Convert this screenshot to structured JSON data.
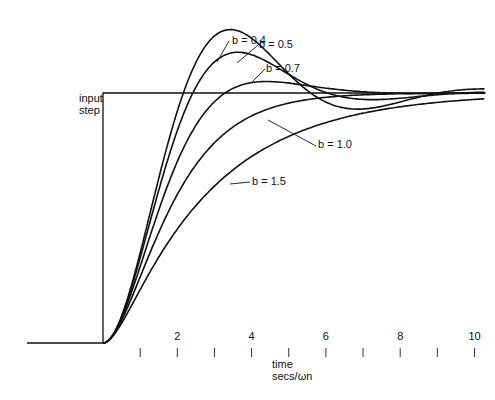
{
  "chart_data": {
    "type": "line",
    "title": "",
    "xlabel": "time secs/ωn",
    "xlabel_lines": [
      "time",
      "secs/ωn"
    ],
    "ylabel": "",
    "x_ticks": [
      1,
      2,
      3,
      4,
      5,
      6,
      7,
      8,
      9,
      10
    ],
    "x_tick_labels": {
      "2": "2",
      "4": "4",
      "6": "6",
      "8": "8",
      "10": "10"
    },
    "xlim": [
      -2.1,
      10.3
    ],
    "ylim": [
      0,
      1.3
    ],
    "grid": false,
    "input_label_lines": [
      "input",
      "step"
    ],
    "input_step": {
      "t_start": 0,
      "level": 1.0
    },
    "series": [
      {
        "name": "b = 0.4",
        "damping": 0.4,
        "label_pos": [
          232,
          44
        ],
        "leader": [
          [
            229,
            41
          ],
          [
            217,
            62
          ]
        ]
      },
      {
        "name": "b = 0.5",
        "damping": 0.5,
        "label_pos": [
          259,
          48
        ],
        "leader": [
          [
            258,
            45
          ],
          [
            237,
            63
          ]
        ]
      },
      {
        "name": "b = 0.7",
        "damping": 0.7,
        "label_pos": [
          266,
          72
        ],
        "leader": [
          [
            265,
            69
          ],
          [
            252,
            82
          ]
        ]
      },
      {
        "name": "b = 1.0",
        "damping": 1.0,
        "label_pos": [
          318,
          148
        ],
        "leader": [
          [
            316,
            146
          ],
          [
            268,
            120
          ]
        ]
      },
      {
        "name": "b = 1.5",
        "damping": 1.5,
        "label_pos": [
          252,
          185
        ],
        "leader": [
          [
            250,
            182
          ],
          [
            230,
            184
          ]
        ]
      }
    ]
  }
}
